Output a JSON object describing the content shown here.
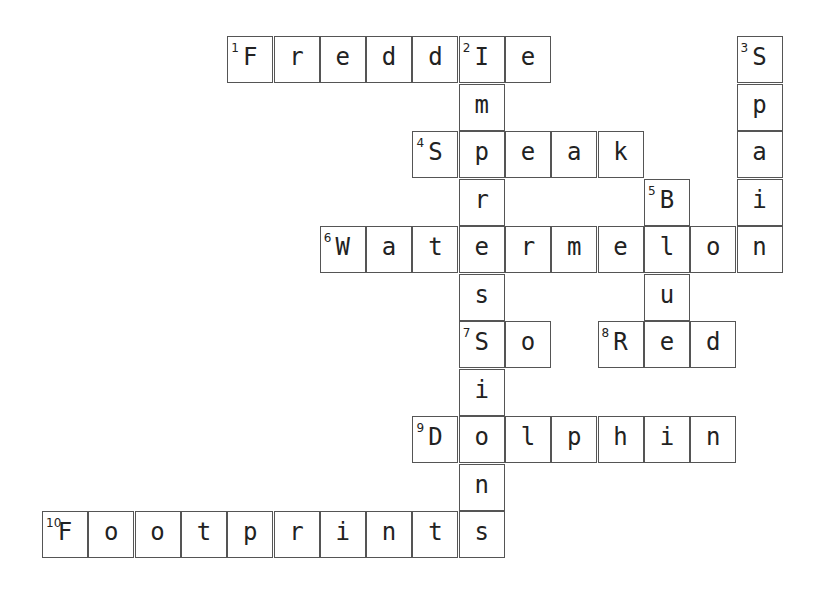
{
  "puzzle": {
    "cell_width": 46.3,
    "cell_height": 47.5,
    "cells": [
      {
        "r": 0,
        "c": 4,
        "ch": "F",
        "n": "1"
      },
      {
        "r": 0,
        "c": 5,
        "ch": "r"
      },
      {
        "r": 0,
        "c": 6,
        "ch": "e"
      },
      {
        "r": 0,
        "c": 7,
        "ch": "d"
      },
      {
        "r": 0,
        "c": 8,
        "ch": "d"
      },
      {
        "r": 0,
        "c": 9,
        "ch": "I",
        "n": "2"
      },
      {
        "r": 0,
        "c": 10,
        "ch": "e"
      },
      {
        "r": 0,
        "c": 15,
        "ch": "S",
        "n": "3"
      },
      {
        "r": 1,
        "c": 9,
        "ch": "m"
      },
      {
        "r": 1,
        "c": 15,
        "ch": "p"
      },
      {
        "r": 2,
        "c": 8,
        "ch": "S",
        "n": "4"
      },
      {
        "r": 2,
        "c": 9,
        "ch": "p"
      },
      {
        "r": 2,
        "c": 10,
        "ch": "e"
      },
      {
        "r": 2,
        "c": 11,
        "ch": "a"
      },
      {
        "r": 2,
        "c": 12,
        "ch": "k"
      },
      {
        "r": 2,
        "c": 15,
        "ch": "a"
      },
      {
        "r": 3,
        "c": 9,
        "ch": "r"
      },
      {
        "r": 3,
        "c": 13,
        "ch": "B",
        "n": "5"
      },
      {
        "r": 3,
        "c": 15,
        "ch": "i"
      },
      {
        "r": 4,
        "c": 6,
        "ch": "W",
        "n": "6"
      },
      {
        "r": 4,
        "c": 7,
        "ch": "a"
      },
      {
        "r": 4,
        "c": 8,
        "ch": "t"
      },
      {
        "r": 4,
        "c": 9,
        "ch": "e"
      },
      {
        "r": 4,
        "c": 10,
        "ch": "r"
      },
      {
        "r": 4,
        "c": 11,
        "ch": "m"
      },
      {
        "r": 4,
        "c": 12,
        "ch": "e"
      },
      {
        "r": 4,
        "c": 13,
        "ch": "l"
      },
      {
        "r": 4,
        "c": 14,
        "ch": "o"
      },
      {
        "r": 4,
        "c": 15,
        "ch": "n"
      },
      {
        "r": 5,
        "c": 9,
        "ch": "s"
      },
      {
        "r": 5,
        "c": 13,
        "ch": "u"
      },
      {
        "r": 6,
        "c": 9,
        "ch": "S",
        "n": "7"
      },
      {
        "r": 6,
        "c": 10,
        "ch": "o"
      },
      {
        "r": 6,
        "c": 12,
        "ch": "R",
        "n": "8"
      },
      {
        "r": 6,
        "c": 13,
        "ch": "e"
      },
      {
        "r": 6,
        "c": 14,
        "ch": "d"
      },
      {
        "r": 7,
        "c": 9,
        "ch": "i"
      },
      {
        "r": 8,
        "c": 8,
        "ch": "D",
        "n": "9"
      },
      {
        "r": 8,
        "c": 9,
        "ch": "o"
      },
      {
        "r": 8,
        "c": 10,
        "ch": "l"
      },
      {
        "r": 8,
        "c": 11,
        "ch": "p"
      },
      {
        "r": 8,
        "c": 12,
        "ch": "h"
      },
      {
        "r": 8,
        "c": 13,
        "ch": "i"
      },
      {
        "r": 8,
        "c": 14,
        "ch": "n"
      },
      {
        "r": 9,
        "c": 9,
        "ch": "n"
      },
      {
        "r": 10,
        "c": 0,
        "ch": "F",
        "n": "10"
      },
      {
        "r": 10,
        "c": 1,
        "ch": "o"
      },
      {
        "r": 10,
        "c": 2,
        "ch": "o"
      },
      {
        "r": 10,
        "c": 3,
        "ch": "t"
      },
      {
        "r": 10,
        "c": 4,
        "ch": "p"
      },
      {
        "r": 10,
        "c": 5,
        "ch": "r"
      },
      {
        "r": 10,
        "c": 6,
        "ch": "i"
      },
      {
        "r": 10,
        "c": 7,
        "ch": "n"
      },
      {
        "r": 10,
        "c": 8,
        "ch": "t"
      },
      {
        "r": 10,
        "c": 9,
        "ch": "s"
      }
    ],
    "answers": {
      "across": [
        {
          "n": "1",
          "word": "Freddie"
        },
        {
          "n": "4",
          "word": "Speak"
        },
        {
          "n": "6",
          "word": "Watermelon"
        },
        {
          "n": "7",
          "word": "So"
        },
        {
          "n": "8",
          "word": "Red"
        },
        {
          "n": "9",
          "word": "Dolphin"
        },
        {
          "n": "10",
          "word": "Footprints"
        }
      ],
      "down": [
        {
          "n": "2",
          "word": "Impressions"
        },
        {
          "n": "3",
          "word": "Spain"
        },
        {
          "n": "5",
          "word": "Blue"
        }
      ]
    }
  }
}
